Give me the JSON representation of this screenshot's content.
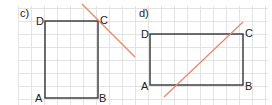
{
  "grid": {
    "color": "#e3e3e3",
    "spacing": 13
  },
  "colors": {
    "rect": "#333333",
    "line": "#e8866a"
  },
  "panels": [
    {
      "label": "c)",
      "vertices": {
        "A": "A",
        "B": "B",
        "C": "C",
        "D": "D"
      },
      "rect": {
        "x": 45,
        "y": 21,
        "w": 53,
        "h": 77
      },
      "line": {
        "x1": 82,
        "y1": 4,
        "x2": 135,
        "y2": 57
      }
    },
    {
      "label": "d)",
      "vertices": {
        "A": "A",
        "B": "B",
        "C": "C",
        "D": "D"
      },
      "rect": {
        "x": 150,
        "y": 34,
        "w": 93,
        "h": 51
      },
      "line": {
        "x1": 164,
        "y1": 97,
        "x2": 243,
        "y2": 22
      }
    }
  ]
}
